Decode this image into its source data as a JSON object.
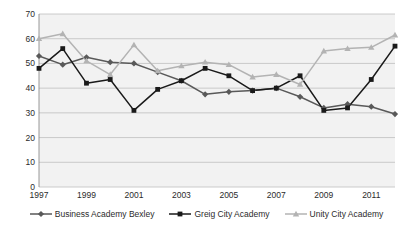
{
  "chart_data": {
    "type": "line",
    "title": "",
    "xlabel": "",
    "ylabel": "",
    "x": [
      1997,
      1998,
      1999,
      2000,
      2001,
      2002,
      2003,
      2004,
      2005,
      2006,
      2007,
      2008,
      2009,
      2010,
      2011,
      2012
    ],
    "xlim": [
      1997,
      2012
    ],
    "ylim": [
      0,
      70
    ],
    "ytick_labels": [
      "70",
      "60",
      "50",
      "40",
      "30",
      "20",
      "10",
      "0"
    ],
    "ytick_values": [
      70,
      60,
      50,
      40,
      30,
      20,
      10,
      0
    ],
    "xtick_labels": [
      "1997",
      "1999",
      "2001",
      "2003",
      "2005",
      "2007",
      "2009",
      "2011"
    ],
    "xtick_values": [
      1997,
      1999,
      2001,
      2003,
      2005,
      2007,
      2009,
      2011
    ],
    "grid": true,
    "grid_axis": "y",
    "legend_position": "bottom",
    "plot_background": "#f2f2f2",
    "series": [
      {
        "name": "Business Academy Bexley",
        "color": "#595959",
        "marker": "diamond",
        "values": [
          53,
          49.5,
          52.5,
          50.5,
          50,
          46.5,
          43,
          37.5,
          38.5,
          39,
          40,
          36.5,
          32,
          33.5,
          32.5,
          29.5
        ]
      },
      {
        "name": "Greig City Academy",
        "color": "#1a1a1a",
        "marker": "square",
        "values": [
          48,
          56,
          42,
          43.5,
          31,
          39.5,
          43,
          48,
          45,
          39,
          40,
          45,
          31,
          32,
          43.5,
          57
        ]
      },
      {
        "name": "Unity City Academy",
        "color": "#b3b3b3",
        "marker": "triangle",
        "values": [
          60,
          62,
          51,
          45.5,
          57.5,
          47,
          49,
          50.5,
          49.5,
          44.5,
          45.5,
          41.5,
          55,
          56,
          56.5,
          61.5
        ]
      }
    ]
  },
  "legend": {
    "items": [
      {
        "label": "Business Academy Bexley",
        "color": "#595959",
        "marker": "diamond"
      },
      {
        "label": "Greig City Academy",
        "color": "#1a1a1a",
        "marker": "square"
      },
      {
        "label": "Unity City Academy",
        "color": "#b3b3b3",
        "marker": "triangle"
      }
    ]
  },
  "colors": {
    "plot_background": "#f2f2f2",
    "gridline": "#bfbfbf",
    "axis": "#8c8c8c",
    "text": "#2b2b2b"
  }
}
